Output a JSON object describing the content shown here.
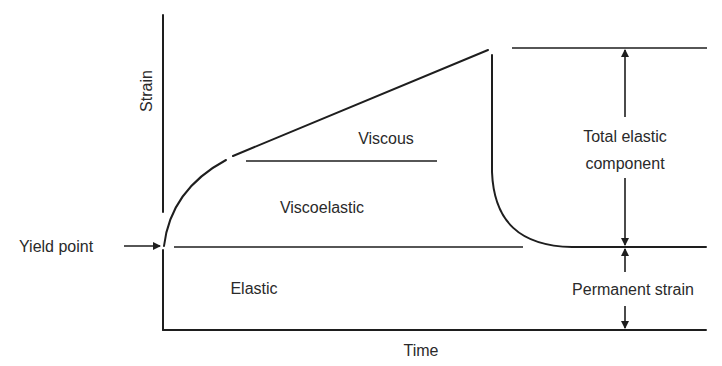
{
  "diagram": {
    "type": "strain-time creep diagram",
    "axes": {
      "y_label": "Strain",
      "x_label": "Time"
    },
    "regions": {
      "viscous": "Viscous",
      "viscoelastic": "Viscoelastic",
      "elastic": "Elastic"
    },
    "annotations": {
      "yield_point": "Yield point",
      "total_elastic_line1": "Total elastic",
      "total_elastic_line2": "component",
      "permanent_strain": "Permanent strain"
    },
    "colors": {
      "line": "#1e1e1e",
      "text": "#2a2a2a",
      "background": "#ffffff"
    }
  }
}
